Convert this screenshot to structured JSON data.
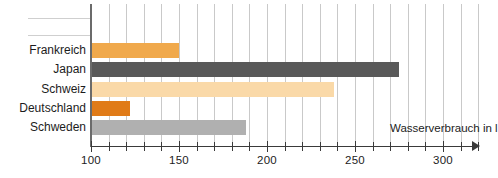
{
  "chart_data": {
    "type": "bar",
    "orientation": "horizontal",
    "title": "",
    "xlabel": "Wasserverbrauch in l",
    "ylabel": "",
    "categories": [
      "Frankreich",
      "Japan",
      "Schweiz",
      "Deutschland",
      "Schweden"
    ],
    "values": [
      150,
      275,
      238,
      122,
      188
    ],
    "series": [
      {
        "name": "Wasserverbrauch in l",
        "values": [
          150,
          275,
          238,
          122,
          188
        ]
      }
    ],
    "bar_colors": [
      "#F0A94C",
      "#595959",
      "#FAD9A8",
      "#E07B18",
      "#B0B0B0"
    ],
    "xlim": [
      100,
      320
    ],
    "xticks": [
      100,
      150,
      200,
      250,
      300
    ],
    "xtick_labels": [
      "100",
      "150",
      "200",
      "250",
      "300"
    ],
    "minor_tick_step": 10,
    "grid": "vertical",
    "legend": "none"
  },
  "axis": {
    "title": "Wasserverbrauch in l"
  }
}
